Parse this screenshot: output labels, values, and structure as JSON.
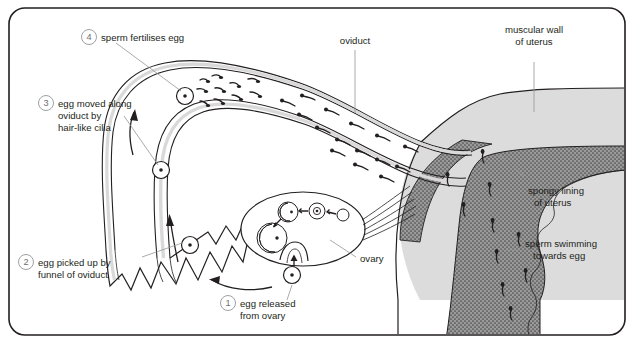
{
  "figure": {
    "frame_color": "#231f20",
    "background_color": "#ffffff"
  },
  "palette": {
    "outline": "#231f20",
    "leader_line": "#939598",
    "number_text": "#6d6e71",
    "label_text": "#231f20",
    "oviduct_wall_fill": "#d9d9d9",
    "muscular_wall_fill": "#dcdcdc",
    "spongy_lining_fill": "#8a8a8a",
    "page_background": "#ffffff"
  },
  "numbered_steps": [
    {
      "number": "1",
      "text_lines": [
        "egg released",
        "from ovary"
      ],
      "label_name": "step-1-egg-released-from-ovary"
    },
    {
      "number": "2",
      "text_lines": [
        "egg picked up by",
        "funnel of oviduct"
      ],
      "label_name": "step-2-egg-picked-up-by-funnel-of-oviduct"
    },
    {
      "number": "3",
      "text_lines": [
        "egg moved along",
        "oviduct by",
        "hair-like cilia"
      ],
      "label_name": "step-3-egg-moved-along-oviduct-by-cilia"
    },
    {
      "number": "4",
      "text_lines": [
        "sperm fertilises egg"
      ],
      "label_name": "step-4-sperm-fertilises-egg"
    }
  ],
  "part_labels": [
    {
      "text_lines": [
        "oviduct"
      ],
      "label_name": "label-oviduct"
    },
    {
      "text_lines": [
        "muscular wall",
        "of uterus"
      ],
      "label_name": "label-muscular-wall-of-uterus"
    },
    {
      "text_lines": [
        "spongy lining",
        "of uterus"
      ],
      "label_name": "label-spongy-lining-of-uterus"
    },
    {
      "text_lines": [
        "sperm swimming",
        "towards egg"
      ],
      "label_name": "label-sperm-swimming-towards-egg"
    },
    {
      "text_lines": [
        "ovary"
      ],
      "label_name": "label-ovary"
    }
  ],
  "structures": {
    "oviduct": "curved double-walled tube from funnel to uterus",
    "funnel": "fimbriated funnel of oviduct with zigzag finger-like edge",
    "ovary": "oval organ containing developing follicles",
    "uterus": "muscular wall with stippled spongy lining"
  },
  "ovary_follicle_stages": [
    {
      "stage": "1",
      "description": "small primary follicle"
    },
    {
      "stage": "2",
      "description": "growing follicle with ovum"
    },
    {
      "stage": "3",
      "description": "mature follicle with antrum"
    },
    {
      "stage": "4",
      "description": "large ripe follicle ready to rupture"
    },
    {
      "stage": "5",
      "description": "ovulation - egg released at surface"
    }
  ],
  "eggs": [
    {
      "position": "at funnel tip",
      "name": "egg-at-funnel"
    },
    {
      "position": "in upper oviduct",
      "name": "egg-in-oviduct"
    },
    {
      "position": "at fertilisation site",
      "name": "egg-being-fertilised"
    },
    {
      "position": "released from ovary",
      "name": "egg-released"
    }
  ]
}
